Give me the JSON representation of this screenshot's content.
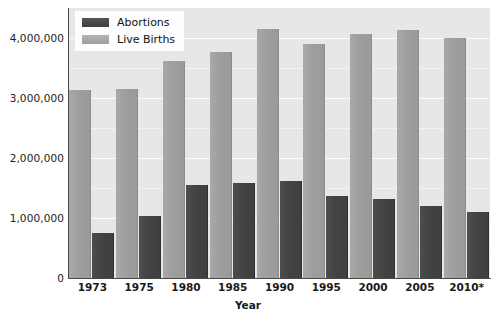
{
  "chart_data": {
    "type": "bar",
    "title": "",
    "subtitle": "",
    "xlabel": "Year",
    "ylabel": "",
    "categories": [
      "1973",
      "1975",
      "1980",
      "1985",
      "1990",
      "1995",
      "2000",
      "2005",
      "2010*"
    ],
    "series": [
      {
        "name": "Abortions",
        "color": "#434343",
        "values": [
          745000,
          1030000,
          1554000,
          1589000,
          1609000,
          1359000,
          1313000,
          1206000,
          1102000
        ]
      },
      {
        "name": "Live Births",
        "color": "#9e9e9c",
        "values": [
          3137000,
          3144000,
          3612000,
          3761000,
          4158000,
          3900000,
          4059000,
          4138000,
          3999000
        ]
      }
    ],
    "ylim": [
      0,
      4500000
    ],
    "yticks": [
      0,
      1000000,
      2000000,
      3000000,
      4000000
    ],
    "ytick_labels": [
      "0",
      "1,000,000",
      "2,000,000",
      "3,000,000",
      "4,000,000"
    ],
    "minor_gridlines": [
      500000,
      1500000,
      2500000,
      3500000
    ],
    "grid": true,
    "legend_position": "top-left",
    "plot_background": "#e7e7e5",
    "gridline_color": "#fbfbfb",
    "axis_color": "#4a4a4a"
  },
  "legend": {
    "items": [
      {
        "label": "Abortions",
        "swatch": "dark-gray-swatch"
      },
      {
        "label": "Live Births",
        "swatch": "light-gray-swatch"
      }
    ]
  },
  "axes": {
    "x_title": "Year"
  }
}
